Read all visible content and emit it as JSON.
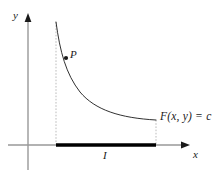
{
  "figure": {
    "type": "math-diagram",
    "background_color": "#ffffff",
    "axes": {
      "x_axis": {
        "label": "x",
        "color": "#999999",
        "arrowhead_color": "#1a1a1a",
        "y_position": 145,
        "x_start": 8,
        "x_end": 190
      },
      "y_axis": {
        "label": "y",
        "color": "#999999",
        "arrowhead_color": "#1a1a1a",
        "x_position": 28,
        "y_start": 14,
        "y_end": 170
      }
    },
    "curve": {
      "label": "F(x, y) = c",
      "color": "#1a1a1a",
      "stroke_width": 0.9,
      "start_point": [
        56,
        22
      ],
      "end_point": [
        156,
        120
      ]
    },
    "point": {
      "label": "P",
      "color": "#1a1a1a",
      "x": 66,
      "y": 58,
      "radius": 2.1
    },
    "interval": {
      "label": "I",
      "color": "#000000",
      "thickness": 3.4,
      "x_start": 56,
      "x_end": 156,
      "y": 145
    },
    "dashed_lines": {
      "color": "#bbbbbb",
      "dash_pattern": "1.6 1.6",
      "left": {
        "x": 56,
        "y_top": 22,
        "y_bottom": 144
      },
      "right": {
        "x": 156,
        "y_top": 120,
        "y_bottom": 144
      }
    }
  }
}
